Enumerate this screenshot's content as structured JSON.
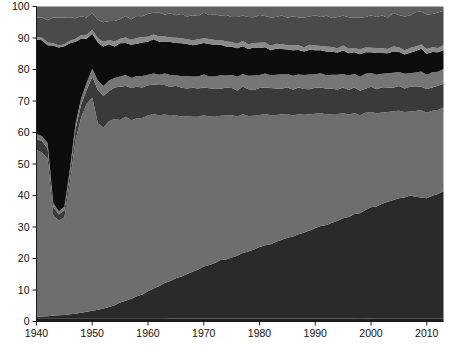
{
  "chart_data": {
    "type": "area",
    "title": "",
    "subtitle": "",
    "xlabel": "",
    "ylabel": "",
    "stacked": true,
    "normalized": true,
    "grid": false,
    "legend": "none",
    "xlim": [
      1940,
      2013
    ],
    "ylim": [
      0,
      100
    ],
    "x_ticks": [
      1940,
      1950,
      1960,
      1970,
      1980,
      1990,
      2000,
      2010
    ],
    "x_tick_labels": [
      "1940",
      "1950",
      "1960",
      "1970",
      "1980",
      "1990",
      "2000",
      "2010"
    ],
    "y_ticks": [
      0,
      10,
      20,
      30,
      40,
      50,
      60,
      70,
      80,
      90,
      100
    ],
    "y_tick_labels": [
      "0",
      "10",
      "20",
      "30",
      "40",
      "50",
      "60",
      "70",
      "80",
      "90",
      "100"
    ],
    "x": [
      1940,
      1941,
      1942,
      1943,
      1944,
      1945,
      1946,
      1947,
      1948,
      1949,
      1950,
      1951,
      1952,
      1953,
      1954,
      1955,
      1956,
      1957,
      1958,
      1959,
      1960,
      1961,
      1962,
      1963,
      1964,
      1965,
      1966,
      1967,
      1968,
      1969,
      1970,
      1971,
      1972,
      1973,
      1974,
      1975,
      1976,
      1977,
      1978,
      1979,
      1980,
      1981,
      1982,
      1983,
      1984,
      1985,
      1986,
      1987,
      1988,
      1989,
      1990,
      1991,
      1992,
      1993,
      1994,
      1995,
      1996,
      1997,
      1998,
      1999,
      2000,
      2001,
      2002,
      2003,
      2004,
      2005,
      2006,
      2007,
      2008,
      2009,
      2010,
      2011,
      2012,
      2013
    ],
    "series": [
      {
        "name": "band-1-bottom-dark",
        "color": "#1c1c1c",
        "values": [
          1.0,
          1.0,
          1.0,
          1.0,
          1.0,
          1.0,
          1.0,
          1.0,
          1.0,
          1.0,
          1.0,
          1.0,
          1.0,
          1.0,
          1.0,
          1.0,
          1.0,
          1.0,
          1.0,
          1.0,
          1.0,
          1.0,
          1.0,
          1.0,
          1.0,
          1.0,
          1.0,
          1.0,
          1.0,
          1.0,
          1.0,
          1.0,
          1.0,
          1.0,
          1.0,
          1.0,
          1.0,
          1.0,
          1.0,
          1.0,
          1.0,
          1.0,
          1.0,
          1.0,
          1.0,
          1.0,
          1.0,
          1.0,
          1.0,
          1.0,
          1.0,
          1.0,
          1.0,
          1.0,
          1.0,
          1.0,
          1.0,
          1.0,
          1.0,
          1.0,
          1.0,
          1.0,
          1.0,
          1.0,
          1.0,
          1.0,
          1.0,
          1.0,
          1.0,
          1.0,
          1.0,
          1.0,
          1.0,
          1.0
        ]
      },
      {
        "name": "band-2-rising-dark",
        "color": "#2a2a2a",
        "values": [
          0.5,
          0.6,
          0.7,
          0.9,
          1.0,
          1.1,
          1.3,
          1.5,
          1.8,
          2.1,
          2.4,
          2.7,
          3.1,
          3.6,
          4.2,
          5.0,
          5.6,
          6.3,
          7.0,
          7.6,
          8.5,
          9.4,
          10.3,
          11.2,
          12.0,
          12.9,
          13.6,
          14.4,
          15.1,
          15.9,
          16.8,
          17.5,
          18.2,
          19.1,
          19.5,
          20.1,
          20.9,
          21.6,
          22.3,
          23.0,
          23.8,
          24.4,
          25.0,
          25.8,
          26.5,
          27.2,
          27.9,
          28.5,
          29.2,
          29.9,
          30.8,
          31.4,
          32.1,
          32.9,
          33.6,
          34.4,
          35.2,
          36.0,
          36.8,
          37.6,
          38.5,
          39.2,
          40.1,
          40.8,
          41.4,
          42.0,
          42.7,
          43.4,
          43.0,
          42.5,
          42.8,
          43.3,
          43.9,
          44.5
        ]
      },
      {
        "name": "band-3-mid-gray",
        "color": "#6e6e6e",
        "values": [
          53.0,
          52.0,
          50.0,
          32.0,
          30.0,
          31.0,
          42.0,
          55.0,
          62.0,
          66.0,
          67.0,
          59.0,
          57.5,
          59.0,
          59.5,
          58.0,
          58.5,
          57.0,
          56.5,
          56.0,
          55.5,
          54.8,
          54.2,
          53.5,
          53.0,
          52.2,
          51.8,
          51.0,
          50.3,
          49.8,
          49.0,
          48.5,
          47.9,
          47.2,
          47.5,
          47.0,
          46.4,
          45.8,
          45.2,
          44.6,
          44.0,
          43.8,
          43.4,
          42.7,
          42.2,
          41.6,
          41.1,
          40.6,
          40.0,
          39.5,
          38.8,
          38.4,
          37.8,
          37.2,
          36.6,
          36.0,
          35.4,
          34.8,
          34.2,
          33.6,
          33.0,
          32.5,
          31.9,
          31.4,
          31.0,
          30.6,
          30.1,
          29.6,
          30.2,
          30.8,
          30.4,
          30.0,
          29.6,
          29.2
        ]
      },
      {
        "name": "band-4-dark-gray",
        "color": "#3a3a3a",
        "values": [
          3.5,
          3.6,
          3.2,
          2.5,
          2.0,
          2.2,
          2.6,
          3.5,
          4.0,
          4.5,
          6.5,
          10.5,
          10.0,
          9.5,
          10.0,
          10.5,
          9.8,
          10.3,
          10.0,
          9.7,
          9.5,
          9.3,
          9.6,
          9.4,
          9.2,
          9.5,
          9.3,
          9.0,
          9.4,
          9.2,
          9.0,
          9.3,
          9.1,
          8.8,
          9.2,
          9.0,
          8.7,
          9.1,
          8.9,
          8.6,
          9.0,
          8.8,
          9.2,
          8.9,
          8.6,
          9.0,
          8.7,
          9.1,
          8.8,
          8.5,
          8.9,
          8.6,
          9.0,
          8.7,
          8.4,
          8.8,
          8.5,
          8.9,
          8.6,
          8.3,
          8.7,
          8.4,
          8.8,
          8.5,
          8.2,
          8.6,
          8.3,
          8.7,
          8.4,
          8.1,
          8.5,
          8.2,
          8.6,
          8.3
        ]
      },
      {
        "name": "band-5-light-gray",
        "color": "#767676",
        "values": [
          1.5,
          1.6,
          1.8,
          1.2,
          1.0,
          1.1,
          1.4,
          1.8,
          2.0,
          2.2,
          2.5,
          3.0,
          3.2,
          3.4,
          3.1,
          3.3,
          3.5,
          3.2,
          3.4,
          3.6,
          3.3,
          3.5,
          3.2,
          3.6,
          3.8,
          3.4,
          3.7,
          4.0,
          3.6,
          3.9,
          4.2,
          3.8,
          4.1,
          4.4,
          4.0,
          4.3,
          4.6,
          4.2,
          4.5,
          4.8,
          4.4,
          4.7,
          4.3,
          4.6,
          4.9,
          4.5,
          4.8,
          4.4,
          4.7,
          5.0,
          4.6,
          4.9,
          4.5,
          4.8,
          5.1,
          4.7,
          5.0,
          4.6,
          4.9,
          5.2,
          4.8,
          5.1,
          4.7,
          5.0,
          5.3,
          4.9,
          5.2,
          4.8,
          5.1,
          5.4,
          5.0,
          5.3,
          4.9,
          5.2
        ]
      },
      {
        "name": "band-6-black",
        "color": "#0d0d0d",
        "values": [
          30.0,
          30.5,
          31.0,
          50.0,
          52.0,
          51.0,
          40.0,
          26.0,
          19.0,
          14.0,
          11.0,
          12.0,
          12.5,
          11.5,
          10.0,
          10.5,
          10.2,
          10.6,
          10.3,
          10.7,
          10.4,
          10.8,
          10.5,
          10.2,
          10.6,
          10.3,
          10.7,
          10.4,
          10.1,
          10.5,
          10.2,
          10.6,
          10.3,
          10.0,
          9.6,
          9.3,
          9.5,
          9.2,
          8.9,
          9.3,
          9.0,
          8.7,
          8.4,
          8.8,
          8.5,
          8.2,
          8.6,
          8.3,
          8.0,
          8.4,
          8.1,
          7.8,
          8.2,
          7.9,
          7.6,
          8.0,
          7.7,
          7.4,
          7.8,
          7.5,
          7.2,
          7.6,
          7.3,
          7.0,
          7.4,
          7.1,
          6.8,
          7.2,
          7.6,
          8.0,
          7.5,
          7.2,
          6.9,
          6.6
        ]
      },
      {
        "name": "band-7-pale-gray",
        "color": "#8a8a8a",
        "values": [
          0.8,
          0.8,
          0.9,
          0.7,
          0.6,
          0.6,
          0.8,
          1.0,
          1.1,
          1.2,
          1.3,
          1.4,
          1.5,
          1.4,
          1.6,
          1.5,
          1.7,
          1.6,
          1.8,
          1.7,
          1.6,
          1.5,
          1.7,
          1.6,
          1.5,
          1.7,
          1.6,
          1.5,
          1.7,
          1.6,
          1.5,
          1.7,
          1.6,
          1.5,
          1.7,
          1.6,
          1.5,
          1.7,
          1.6,
          1.5,
          1.7,
          1.6,
          1.5,
          1.7,
          1.6,
          1.5,
          1.7,
          1.6,
          1.5,
          1.7,
          1.6,
          1.5,
          1.7,
          1.6,
          1.5,
          1.7,
          1.6,
          1.5,
          1.7,
          1.6,
          1.5,
          1.7,
          1.6,
          1.5,
          1.7,
          1.6,
          1.5,
          1.7,
          1.6,
          1.5,
          1.7,
          1.6,
          1.5,
          1.7
        ]
      },
      {
        "name": "band-8-top-mid-gray",
        "color": "#4a4a4a",
        "values": [
          6.2,
          6.4,
          7.0,
          8.2,
          8.9,
          8.5,
          7.5,
          6.5,
          6.0,
          5.5,
          5.3,
          5.8,
          6.2,
          6.0,
          6.6,
          6.2,
          6.9,
          6.5,
          7.0,
          6.6,
          7.2,
          6.8,
          7.5,
          7.0,
          7.7,
          7.2,
          7.9,
          7.4,
          8.1,
          7.6,
          8.3,
          7.8,
          8.5,
          8.0,
          8.7,
          8.2,
          8.9,
          8.4,
          9.1,
          8.6,
          9.3,
          8.8,
          9.5,
          9.0,
          9.7,
          9.2,
          9.9,
          9.4,
          10.1,
          9.6,
          10.3,
          9.8,
          10.5,
          10.0,
          10.7,
          10.2,
          10.9,
          10.4,
          11.1,
          10.6,
          11.3,
          10.8,
          11.5,
          11.0,
          11.7,
          11.2,
          11.9,
          11.4,
          12.1,
          11.6,
          12.3,
          11.8,
          12.5,
          12.0
        ]
      },
      {
        "name": "band-9-top-remainder",
        "color": "#5f5f5f",
        "values": [
          3.5,
          3.5,
          4.4,
          3.5,
          3.5,
          3.5,
          3.4,
          3.7,
          3.1,
          3.5,
          2.0,
          4.2,
          5.0,
          4.6,
          4.6,
          4.0,
          3.0,
          4.1,
          3.0,
          3.1,
          2.3,
          2.0,
          2.0,
          2.5,
          2.2,
          2.8,
          2.4,
          3.2,
          2.8,
          3.1,
          2.0,
          2.8,
          2.5,
          3.0,
          2.8,
          3.5,
          3.5,
          3.0,
          3.5,
          3.6,
          2.8,
          3.2,
          3.7,
          3.5,
          3.0,
          3.8,
          3.3,
          3.7,
          3.7,
          3.4,
          3.0,
          3.6,
          3.2,
          3.9,
          3.6,
          3.2,
          3.7,
          3.9,
          3.9,
          3.6,
          3.0,
          3.7,
          3.1,
          3.8,
          2.3,
          3.0,
          3.5,
          3.2,
          2.0,
          1.7,
          2.8,
          2.6,
          2.1,
          1.5
        ]
      }
    ]
  },
  "axes": {
    "y_title": "",
    "x_title": ""
  }
}
